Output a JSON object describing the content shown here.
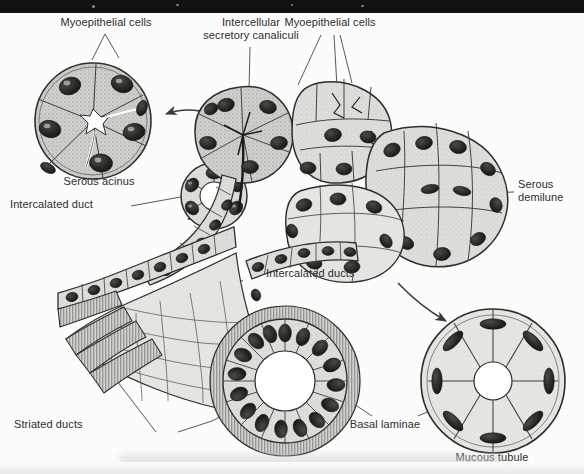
{
  "figure": {
    "style": "grayscale stippled line drawing, scanned textbook plate",
    "background_color": "#fcfcfc",
    "ink_color": "#2c2c2c",
    "top_bar_color": "#111113"
  },
  "labels": {
    "myoepithelial_cells_left": "Myoepithelial cells",
    "intercellular_secretory_canaliculi": "Intercellular\nsecretory canaliculi",
    "myoepithelial_cells_right": "Myoepithelial cells",
    "serous_acinus": "Serous acinus",
    "intercalated_duct": "Intercalated duct",
    "serous_demilune": "Serous\ndemilune",
    "intercalated_ducts": "Intercalated ducts",
    "striated_ducts": "Striated ducts",
    "basal_laminae": "Basal laminae",
    "mucous_tubule": "Mucous tubule"
  },
  "structures": [
    {
      "name": "serous-acinus-inset",
      "caption": "Serous acinus",
      "kind": "cross-section",
      "cells": 6,
      "lumen": "star-shaped"
    },
    {
      "name": "intercalated-duct-inset",
      "caption": "Intercalated duct",
      "kind": "cross-section",
      "cells": 7,
      "lumen": "round-small"
    },
    {
      "name": "striated-duct-inset",
      "caption": "Striated ducts",
      "kind": "cross-section",
      "cells": 16,
      "lumen": "round-large"
    },
    {
      "name": "mucous-tubule-inset",
      "caption": "Mucous tubule",
      "kind": "cross-section",
      "cells": 8,
      "lumen": "round-small"
    },
    {
      "name": "central-gland-complex",
      "caption": "",
      "kind": "three-dimensional cutaway",
      "cells": 0,
      "lumen": "branching"
    }
  ]
}
